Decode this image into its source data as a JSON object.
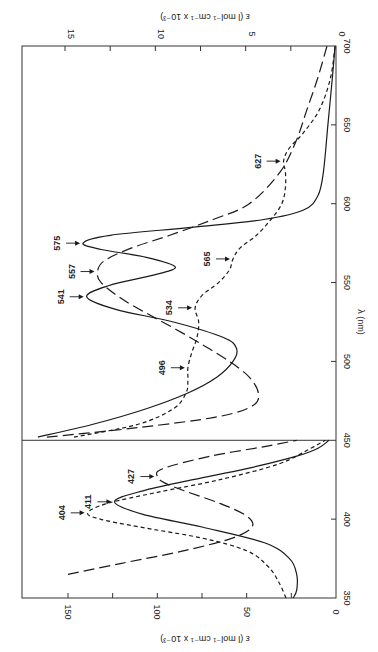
{
  "chart_data": {
    "type": "line",
    "orientation": "rotated-90-clockwise",
    "title": "",
    "xlabel": "λ (nm)",
    "xlim": [
      350,
      700
    ],
    "x_ticks": [
      350,
      400,
      450,
      500,
      550,
      600,
      650,
      700
    ],
    "panels": [
      {
        "name": "left",
        "x_range": [
          350,
          450
        ],
        "ylabel": "ε (l mol⁻¹ cm⁻¹ x 10⁻³)",
        "ylim": [
          0,
          165
        ],
        "y_ticks": [
          0,
          25,
          50,
          75,
          100,
          125,
          150
        ],
        "y_tick_labels": [
          "0",
          "",
          "50",
          "",
          "100",
          "",
          "150"
        ]
      },
      {
        "name": "right",
        "x_range": [
          450,
          700
        ],
        "ylabel": "ε (l mol⁻¹ cm⁻¹ x 10⁻³)",
        "ylim": [
          0,
          16.5
        ],
        "y_ticks": [
          0,
          2.5,
          5,
          7.5,
          10,
          12.5,
          15
        ],
        "y_tick_labels": [
          "0",
          "",
          "5",
          "",
          "10",
          "",
          "15"
        ]
      }
    ],
    "series": [
      {
        "name": "solid",
        "style": "solid",
        "left": {
          "x": [
            350,
            355,
            365,
            375,
            385,
            395,
            403,
            411,
            418,
            425,
            432,
            440,
            445,
            450
          ],
          "y": [
            24,
            22,
            22,
            26,
            40,
            75,
            108,
            124,
            108,
            80,
            50,
            22,
            10,
            4
          ]
        },
        "right": {
          "x": [
            452,
            460,
            470,
            480,
            490,
            500,
            508,
            515,
            525,
            533,
            541,
            548,
            555,
            560,
            566,
            571,
            575,
            580,
            585,
            590,
            596,
            605,
            620,
            650,
            680,
            700
          ],
          "y": [
            16.5,
            13.5,
            10.5,
            8.2,
            6.6,
            5.7,
            5.5,
            6.2,
            9.0,
            12.2,
            13.8,
            12.6,
            10.0,
            8.9,
            10.5,
            13.0,
            14.0,
            12.5,
            8.0,
            4.0,
            1.8,
            1.0,
            0.7,
            0.45,
            0.2,
            0.05
          ]
        }
      },
      {
        "name": "long-dash",
        "style": "long-dash",
        "left": {
          "x": [
            365,
            372,
            380,
            388,
            395,
            402,
            410,
            418,
            423,
            427,
            432,
            440,
            446,
            450
          ],
          "y": [
            150,
            120,
            85,
            58,
            47,
            50,
            65,
            85,
            96,
            100,
            97,
            70,
            40,
            22
          ]
        },
        "right": {
          "x": [
            452,
            458,
            465,
            472,
            480,
            490,
            500,
            510,
            520,
            530,
            540,
            550,
            557,
            564,
            572,
            580,
            590,
            600,
            620,
            640,
            660,
            680,
            700
          ],
          "y": [
            16.0,
            11.0,
            6.5,
            4.6,
            4.3,
            4.8,
            5.9,
            7.3,
            8.8,
            10.4,
            11.9,
            13.0,
            13.2,
            12.8,
            11.3,
            9.2,
            6.8,
            4.8,
            3.1,
            2.2,
            1.6,
            1.0,
            0.5
          ]
        }
      },
      {
        "name": "short-dash",
        "style": "short-dash",
        "left": {
          "x": [
            350,
            360,
            370,
            380,
            388,
            395,
            400,
            404,
            410,
            417,
            425,
            435,
            445,
            450
          ],
          "y": [
            28,
            32,
            38,
            50,
            75,
            110,
            132,
            139,
            128,
            100,
            65,
            32,
            14,
            6
          ]
        },
        "right": {
          "x": [
            452,
            460,
            470,
            480,
            488,
            496,
            505,
            515,
            525,
            534,
            542,
            550,
            558,
            565,
            572,
            580,
            590,
            600,
            610,
            620,
            627,
            635,
            645,
            660,
            680,
            700
          ],
          "y": [
            14.5,
            11.0,
            9.0,
            8.3,
            8.2,
            8.2,
            8.0,
            7.7,
            7.6,
            7.8,
            7.4,
            6.5,
            5.9,
            5.7,
            5.3,
            4.4,
            3.6,
            3.0,
            2.8,
            2.8,
            2.9,
            2.6,
            1.8,
            0.9,
            0.3,
            0.05
          ]
        }
      }
    ],
    "annotations": [
      {
        "label": "404",
        "x": 404,
        "y": 139,
        "panel": "left",
        "series": "short-dash"
      },
      {
        "label": "411",
        "x": 411,
        "y": 124,
        "panel": "left",
        "series": "solid"
      },
      {
        "label": "427",
        "x": 427,
        "y": 100,
        "panel": "left",
        "series": "long-dash"
      },
      {
        "label": "496",
        "x": 496,
        "y": 8.2,
        "panel": "right",
        "series": "short-dash"
      },
      {
        "label": "534",
        "x": 534,
        "y": 7.8,
        "panel": "right",
        "series": "short-dash"
      },
      {
        "label": "541",
        "x": 541,
        "y": 13.8,
        "panel": "right",
        "series": "solid"
      },
      {
        "label": "557",
        "x": 557,
        "y": 13.2,
        "panel": "right",
        "series": "long-dash"
      },
      {
        "label": "565",
        "x": 565,
        "y": 5.7,
        "panel": "right",
        "series": "short-dash"
      },
      {
        "label": "575",
        "x": 575,
        "y": 14.0,
        "panel": "right",
        "series": "solid"
      },
      {
        "label": "627",
        "x": 627,
        "y": 2.9,
        "panel": "right",
        "series": "short-dash"
      }
    ],
    "grid": false,
    "legend": null
  },
  "labels": {
    "x_axis": "λ (nm)",
    "left_y_axis": "ε (l mol⁻¹ cm⁻¹ x 10⁻³)",
    "right_y_axis": "ε (l mol⁻¹ cm⁻¹ x 10⁻³)"
  },
  "colors": {
    "line": "#1a1a1a",
    "frame": "#333333",
    "background": "#ffffff"
  }
}
